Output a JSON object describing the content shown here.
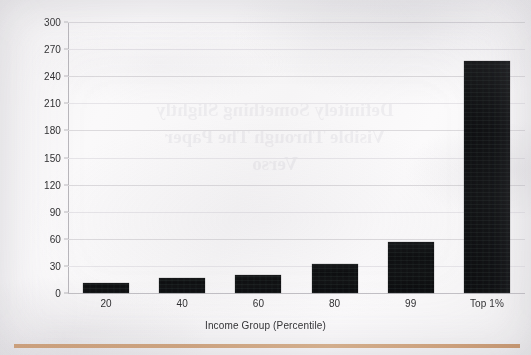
{
  "chart_data": {
    "type": "bar",
    "title": "",
    "xlabel": "Income Group (Percentile)",
    "ylabel": "% Increase in After-Tax Income",
    "categories": [
      "20",
      "40",
      "60",
      "80",
      "99",
      "Top 1%"
    ],
    "values": [
      11,
      17,
      20,
      32,
      56,
      257
    ],
    "ylim": [
      0,
      300
    ],
    "yticks": [
      0,
      30,
      60,
      90,
      120,
      150,
      180,
      210,
      240,
      270,
      300
    ],
    "ytick_labels": [
      "0",
      "30",
      "60",
      "90",
      "120",
      "150",
      "180",
      "210",
      "240",
      "270",
      "300"
    ],
    "grid": true,
    "legend": false,
    "bar_color": "#111214",
    "series": [
      {
        "name": "% Increase in After-Tax Income",
        "values": [
          11,
          17,
          20,
          32,
          56,
          257
        ]
      }
    ]
  },
  "page": {
    "background_color": "#f7f6f6",
    "rule_color": "#c89a74",
    "bleedthrough_text": "Definitely Something Slightly Visible Through The Paper Verso"
  }
}
